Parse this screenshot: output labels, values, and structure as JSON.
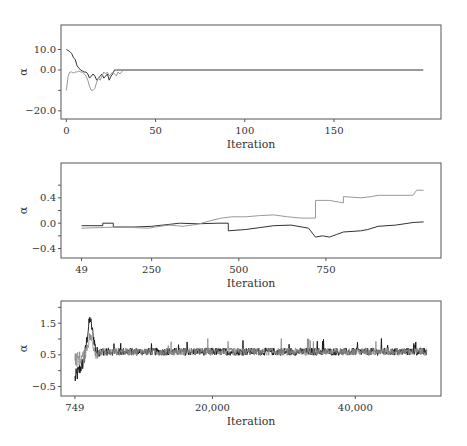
{
  "chart_data": [
    {
      "type": "line",
      "title": "",
      "xlabel": "Iteration",
      "ylabel": "α",
      "xlim": [
        -3,
        210
      ],
      "ylim": [
        -24,
        22
      ],
      "xticks": [
        0,
        50,
        100,
        150
      ],
      "xtick_labels": [
        "0",
        "50",
        "100",
        "150"
      ],
      "yticks": [
        10,
        0,
        -20
      ],
      "ytick_labels": [
        "10.0",
        "0.0",
        "−20.0"
      ],
      "yminor": [
        10,
        0,
        -10,
        -20
      ],
      "frame": {
        "x": 61,
        "y": 25,
        "w": 380,
        "h": 94
      },
      "series": [
        {
          "name": "chain 1",
          "color": "#333333",
          "x": [
            0,
            1,
            2,
            3,
            4,
            5,
            6,
            7,
            8,
            9,
            10,
            11,
            12,
            13,
            14,
            15,
            16,
            17,
            18,
            19,
            20,
            21,
            22,
            23,
            24,
            25,
            26,
            27,
            28,
            200
          ],
          "y": [
            10,
            9.5,
            9,
            8,
            6,
            5,
            2,
            1,
            0,
            -0.5,
            -1,
            -1,
            -2,
            -4,
            -3,
            -2,
            -3,
            -5,
            -4,
            -3,
            -2,
            -4,
            -3,
            -2,
            -5,
            -3,
            -2,
            0,
            0,
            0
          ]
        },
        {
          "name": "chain 2",
          "color": "#999999",
          "x": [
            0,
            1,
            2,
            3,
            4,
            5,
            6,
            7,
            8,
            9,
            10,
            11,
            12,
            13,
            14,
            15,
            16,
            17,
            18,
            19,
            20,
            21,
            22,
            23,
            24,
            25,
            26,
            27,
            28,
            29,
            30,
            31,
            32,
            33,
            200
          ],
          "y": [
            -10,
            -3,
            -1,
            -1,
            -1.5,
            -1,
            -1,
            -0.5,
            -1,
            -1,
            -2,
            -3,
            -5,
            -8,
            -10,
            -10,
            -9,
            -6,
            -4,
            -5,
            -3,
            -1,
            -2,
            -1,
            -3,
            -2,
            -1,
            -2,
            -3,
            -1,
            -2,
            -1,
            0,
            0,
            0
          ]
        }
      ]
    },
    {
      "type": "line",
      "title": "",
      "xlabel": "Iteration",
      "ylabel": "α",
      "xlim": [
        -10,
        1080
      ],
      "ylim": [
        -0.55,
        0.95
      ],
      "xticks": [
        49,
        250,
        500,
        750
      ],
      "xtick_labels": [
        "49",
        "250",
        "500",
        "750"
      ],
      "yticks": [
        0.4,
        0.0,
        -0.4
      ],
      "ytick_labels": [
        "0.4",
        "0.0",
        "−0.4"
      ],
      "yminor": [
        0.6,
        0.4,
        0.2,
        0.0,
        -0.2,
        -0.4
      ],
      "frame": {
        "x": 61,
        "y": 163,
        "w": 380,
        "h": 95
      },
      "series": [
        {
          "name": "chain 1",
          "color": "#333333",
          "x": [
            49,
            110,
            110,
            140,
            140,
            200,
            250,
            300,
            330,
            380,
            440,
            470,
            470,
            520,
            560,
            600,
            650,
            700,
            720,
            740,
            760,
            780,
            800,
            850,
            870,
            900,
            950,
            1000,
            1030
          ],
          "y": [
            -0.04,
            -0.04,
            0.0,
            0.0,
            -0.06,
            -0.06,
            -0.05,
            -0.02,
            0.0,
            -0.01,
            0.0,
            0.0,
            -0.12,
            -0.1,
            -0.07,
            -0.04,
            -0.03,
            -0.08,
            -0.22,
            -0.2,
            -0.22,
            -0.18,
            -0.14,
            -0.12,
            -0.1,
            -0.05,
            -0.03,
            0.01,
            0.02
          ]
        },
        {
          "name": "chain 2",
          "color": "#999999",
          "x": [
            49,
            100,
            150,
            200,
            240,
            260,
            300,
            340,
            380,
            420,
            450,
            480,
            520,
            560,
            600,
            640,
            680,
            720,
            720,
            760,
            800,
            800,
            850,
            880,
            900,
            1000,
            1010,
            1030
          ],
          "y": [
            -0.08,
            -0.07,
            -0.06,
            -0.07,
            -0.08,
            -0.06,
            -0.03,
            -0.05,
            -0.02,
            0.04,
            0.08,
            0.1,
            0.1,
            0.12,
            0.13,
            0.1,
            0.08,
            0.08,
            0.36,
            0.36,
            0.32,
            0.42,
            0.4,
            0.42,
            0.44,
            0.44,
            0.52,
            0.52
          ]
        }
      ]
    },
    {
      "type": "line",
      "title": "",
      "xlabel": "Iteration",
      "ylabel": "α",
      "xlim": [
        -1200,
        52000
      ],
      "ylim": [
        -0.8,
        2.2
      ],
      "xticks": [
        749,
        20000,
        40000
      ],
      "xtick_labels": [
        "749",
        "20,000",
        "40,000"
      ],
      "yticks": [
        1.5,
        0.5,
        -0.5
      ],
      "ytick_labels": [
        "1.5",
        "0.5",
        "−0.5"
      ],
      "yminor": [
        2.0,
        1.5,
        1.0,
        0.5,
        0.0,
        -0.5
      ],
      "frame": {
        "x": 61,
        "y": 301,
        "w": 380,
        "h": 95
      },
      "noise": {
        "x_start": 749,
        "x_end": 50000,
        "mean": 0.6,
        "amp": 0.12,
        "burnin_end": 5000,
        "peak": 1.65,
        "start_low": -0.25
      },
      "series": [
        {
          "name": "chain 1",
          "color": "#111111"
        },
        {
          "name": "chain 2",
          "color": "#888888"
        }
      ]
    }
  ]
}
